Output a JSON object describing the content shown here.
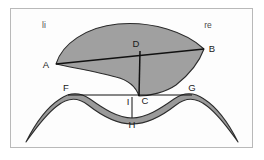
{
  "figure": {
    "frame": {
      "x": 10,
      "y": 8,
      "width": 243,
      "height": 140,
      "border_color": "#b9b9b9"
    },
    "background_color": "#ffffff",
    "fill_color": "#a0a0a0",
    "stroke_color": "#1a1a1a",
    "band_fill_color": "#9a9a9a",
    "side_labels": [
      {
        "id": "li",
        "text": "li",
        "x": 44,
        "y": 27,
        "meaning": "links"
      },
      {
        "id": "re",
        "text": "re",
        "x": 207,
        "y": 27,
        "meaning": "rechts"
      }
    ],
    "points": [
      {
        "id": "A",
        "text": "A",
        "x": 56,
        "y": 64,
        "label_x": 46,
        "label_y": 68
      },
      {
        "id": "B",
        "text": "B",
        "x": 204,
        "y": 49,
        "label_x": 210,
        "label_y": 51
      },
      {
        "id": "C",
        "text": "C",
        "x": 139,
        "y": 96,
        "label_x": 143,
        "label_y": 104
      },
      {
        "id": "D",
        "text": "D",
        "x": 140,
        "y": 51,
        "label_x": 135,
        "label_y": 47
      },
      {
        "id": "F",
        "text": "F",
        "x": 68,
        "y": 95,
        "label_x": 64,
        "label_y": 91
      },
      {
        "id": "G",
        "text": "G",
        "x": 192,
        "y": 95,
        "label_x": 190,
        "label_y": 91
      },
      {
        "id": "H",
        "text": "H",
        "x": 132,
        "y": 118,
        "label_x": 128,
        "label_y": 128
      },
      {
        "id": "I",
        "text": "I",
        "x": 132,
        "y": 100,
        "label_x": 129,
        "label_y": 104
      }
    ],
    "segments": [
      {
        "id": "A-B",
        "from": "A",
        "to": "B"
      },
      {
        "id": "D-C",
        "from": "D",
        "to": "C"
      },
      {
        "id": "F-G",
        "from": "F",
        "to": "G"
      },
      {
        "id": "I-H",
        "from": "I",
        "to": "H"
      }
    ],
    "shapes": [
      {
        "id": "upper-wedge",
        "kind": "filled-fan",
        "description": "shaded fan-shaped region with apex at C"
      },
      {
        "id": "lower-band",
        "kind": "wavy-ribbon",
        "description": "double-hump wavy band below"
      }
    ]
  }
}
